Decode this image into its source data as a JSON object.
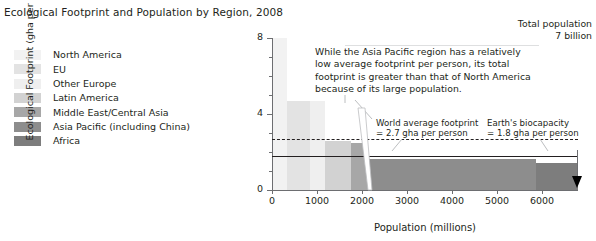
{
  "title": "Ecological Footprint and Population by Region, 2008",
  "legend": {
    "items": [
      {
        "label": "North America",
        "color": "#f2f2f2"
      },
      {
        "label": "EU",
        "color": "#e3e3e3"
      },
      {
        "label": "Other Europe",
        "color": "#efefef"
      },
      {
        "label": "Latin America",
        "color": "#d2d2d2"
      },
      {
        "label": "Middle East/Central Asia",
        "color": "#a7a7a7"
      },
      {
        "label": "Asia Pacific (including China)",
        "color": "#8d8d8d"
      },
      {
        "label": "Africa",
        "color": "#7d7d7d"
      }
    ]
  },
  "annotation": "While the Asia Pacific region has a relatively low average footprint per person, its total footprint is greater than that of North America because of its large population.",
  "callouts": {
    "world_average": "World average footprint\n= 2.7 gha per person",
    "world_average_line1": "World average footprint",
    "world_average_line2": "= 2.7 gha per person",
    "biocapacity_line1": "Earth's biocapacity",
    "biocapacity_line2": "= 1.8 gha per person"
  },
  "total_population": {
    "line1": "Total population",
    "line2": "7 billion"
  },
  "chart_data": {
    "type": "bar",
    "title": "Ecological Footprint and Population by Region, 2008",
    "xlabel": "Population (millions)",
    "ylabel": "Ecological Footprint (gha per capita)",
    "xlim": [
      0,
      6800
    ],
    "ylim": [
      0,
      8
    ],
    "xticks": [
      0,
      1000,
      2000,
      3000,
      4000,
      5000,
      6000
    ],
    "yticks": [
      0,
      4,
      8
    ],
    "yminorticks": [
      1,
      2,
      3,
      5,
      6,
      7
    ],
    "grid": false,
    "legend_position": "left-outside",
    "note": "Width of each bar = population (millions); height = per-capita Ecological Footprint (gha). Area = total footprint.",
    "categories": [
      "North America",
      "EU",
      "Other Europe",
      "Latin America",
      "Middle East/Central Asia",
      "Asia Pacific (including China)",
      "Africa"
    ],
    "bars": [
      {
        "name": "North America",
        "x_start": 0,
        "x_end": 340,
        "population": 340,
        "footprint": 8.0,
        "color": "#f2f2f2"
      },
      {
        "name": "EU",
        "x_start": 340,
        "x_end": 840,
        "population": 500,
        "footprint": 4.7,
        "color": "#e3e3e3"
      },
      {
        "name": "Other Europe",
        "x_start": 840,
        "x_end": 1180,
        "population": 340,
        "footprint": 4.7,
        "color": "#efefef"
      },
      {
        "name": "Latin America",
        "x_start": 1180,
        "x_end": 1760,
        "population": 580,
        "footprint": 2.6,
        "color": "#d2d2d2"
      },
      {
        "name": "Middle East/Central Asia",
        "x_start": 1760,
        "x_end": 2130,
        "population": 370,
        "footprint": 2.5,
        "color": "#a7a7a7"
      },
      {
        "name": "Asia Pacific (including China)",
        "x_start": 2130,
        "x_end": 5870,
        "population": 3740,
        "footprint": 1.65,
        "color": "#8d8d8d"
      },
      {
        "name": "Africa",
        "x_start": 5870,
        "x_end": 6800,
        "population": 930,
        "footprint": 1.4,
        "color": "#7d7d7d"
      }
    ],
    "reference_lines": [
      {
        "name": "World average footprint",
        "value": 2.7,
        "units": "gha per person",
        "style": "dashed"
      },
      {
        "name": "Earth's biocapacity",
        "value": 1.8,
        "units": "gha per person",
        "style": "solid"
      }
    ],
    "annotations": [
      {
        "text": "While the Asia Pacific region has a relatively low average footprint per person, its total footprint is greater than that of North America because of its large population."
      },
      {
        "text": "Total population 7 billion"
      }
    ]
  }
}
